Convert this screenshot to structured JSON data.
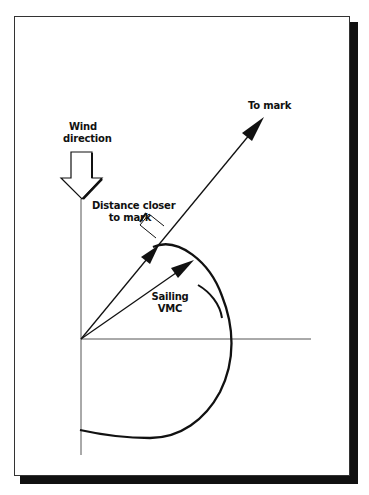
{
  "diagram": {
    "labels": {
      "to_mark": "To mark",
      "wind_line1": "Wind",
      "wind_line2": "direction",
      "distance_line1": "Distance closer",
      "distance_line2": "to mark",
      "sailing_line1": "Sailing",
      "sailing_line2": "VMC"
    },
    "colors": {
      "ink": "#111111",
      "axis": "#555555",
      "background": "#ffffff",
      "shadow": "#111111"
    },
    "elements": [
      "wind-direction-arrow",
      "to-mark-vector",
      "sailing-vmc-vector",
      "polar-curve",
      "distance-closer-bracket",
      "tack-arc",
      "x-axis",
      "y-axis"
    ]
  }
}
